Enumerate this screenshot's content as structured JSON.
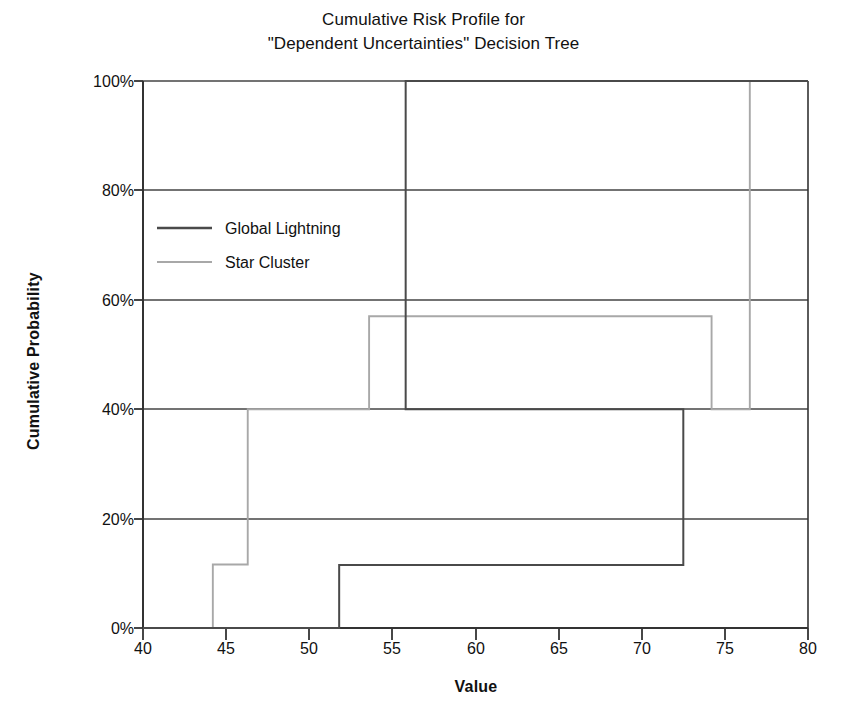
{
  "chart_data": {
    "type": "line",
    "subtype": "step",
    "title": "Cumulative Risk Profile for \"Dependent Uncertainties\" Decision Tree",
    "title_line1": "Cumulative Risk Profile for",
    "title_line2": "\"Dependent Uncertainties\" Decision Tree",
    "xlabel": "Value",
    "ylabel": "Cumulative Probability",
    "xlim": [
      40,
      80
    ],
    "ylim": [
      0,
      100
    ],
    "xticks": [
      40,
      45,
      50,
      55,
      60,
      65,
      70,
      75,
      80
    ],
    "xtick_labels": [
      "40",
      "45",
      "50",
      "55",
      "60",
      "65",
      "70",
      "75",
      "80"
    ],
    "yticks": [
      0,
      20,
      40,
      60,
      80,
      100
    ],
    "ytick_labels": [
      "0%",
      "20%",
      "40%",
      "60%",
      "80%",
      "100%"
    ],
    "grid": "horizontal",
    "legend_position": "upper-left-inside",
    "series": [
      {
        "name": "Global Lightning",
        "color": "#4a4a4a",
        "points": [
          {
            "x": 40.0,
            "y": 0
          },
          {
            "x": 51.8,
            "y": 0
          },
          {
            "x": 51.8,
            "y": 11.5
          },
          {
            "x": 72.5,
            "y": 11.5
          },
          {
            "x": 72.5,
            "y": 40
          },
          {
            "x": 55.8,
            "y": 40
          },
          {
            "x": 55.8,
            "y": 100
          },
          {
            "x": 80.0,
            "y": 100
          }
        ],
        "steps": [
          {
            "x": 51.8,
            "from": 0,
            "to": 11.5
          },
          {
            "x": 72.5,
            "from": 11.5,
            "to": 40
          },
          {
            "x": 55.8,
            "from": 40,
            "to": 100
          }
        ]
      },
      {
        "name": "Star Cluster",
        "color": "#a8a8a8",
        "points": [
          {
            "x": 40.0,
            "y": 0
          },
          {
            "x": 44.2,
            "y": 0
          },
          {
            "x": 44.2,
            "y": 11.6
          },
          {
            "x": 46.3,
            "y": 11.6
          },
          {
            "x": 46.3,
            "y": 40
          },
          {
            "x": 53.6,
            "y": 40
          },
          {
            "x": 53.6,
            "y": 57
          },
          {
            "x": 74.2,
            "y": 57
          },
          {
            "x": 74.2,
            "y": 40
          },
          {
            "x": 76.5,
            "y": 40
          },
          {
            "x": 76.5,
            "y": 100
          },
          {
            "x": 80.0,
            "y": 100
          }
        ],
        "steps": [
          {
            "x": 44.2,
            "from": 0,
            "to": 11.6
          },
          {
            "x": 46.3,
            "from": 11.6,
            "to": 40
          },
          {
            "x": 53.6,
            "from": 40,
            "to": 57
          },
          {
            "x": 74.2,
            "from": 57,
            "to": 40
          },
          {
            "x": 76.5,
            "from": 40,
            "to": 100
          }
        ]
      }
    ]
  },
  "legend": {
    "items": [
      {
        "label": "Global Lightning",
        "color": "#4a4a4a"
      },
      {
        "label": "Star Cluster",
        "color": "#a8a8a8"
      }
    ]
  },
  "colors": {
    "axis": "#333333",
    "grid": "#444444",
    "background": "#ffffff",
    "series_primary": "#4a4a4a",
    "series_secondary": "#a8a8a8"
  }
}
